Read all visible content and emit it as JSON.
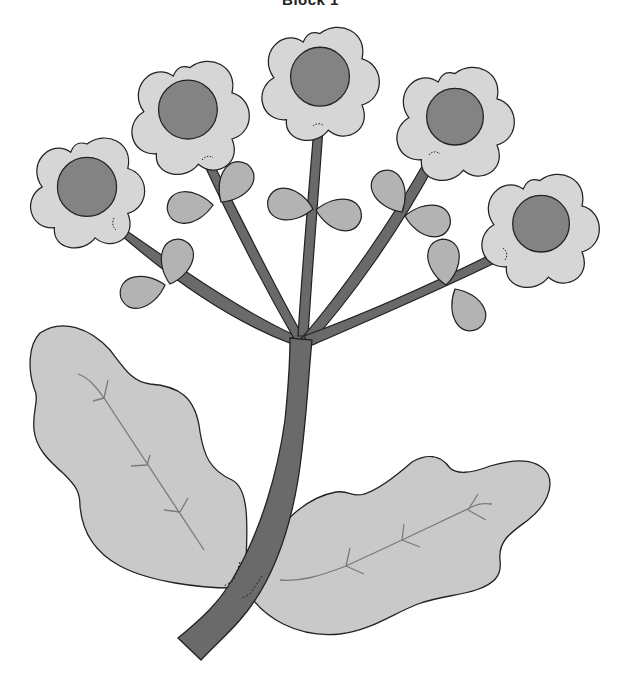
{
  "title": "Block 1",
  "colors": {
    "background": "#ffffff",
    "outline": "#222222",
    "stem": "#6a6a6a",
    "petal": "#d6d6d6",
    "flower_center": "#838383",
    "small_leaf": "#b3b3b3",
    "big_leaf": "#c9c9c9",
    "vein": "#7a7a7a"
  },
  "flowers": [
    {
      "id": "flower-1",
      "cx": 87,
      "cy": 193,
      "r": 29
    },
    {
      "id": "flower-2",
      "cx": 188,
      "cy": 112,
      "r": 29
    },
    {
      "id": "flower-3",
      "cx": 320,
      "cy": 77,
      "r": 29
    },
    {
      "id": "flower-4",
      "cx": 455,
      "cy": 117,
      "r": 28
    },
    {
      "id": "flower-5",
      "cx": 541,
      "cy": 224,
      "r": 28
    }
  ],
  "small_leaves_count": 10,
  "big_leaves_count": 2
}
